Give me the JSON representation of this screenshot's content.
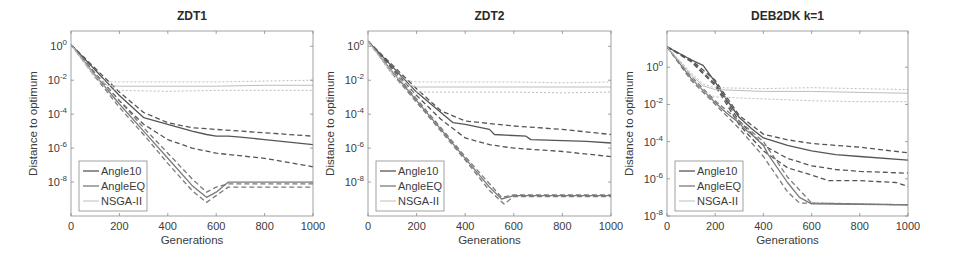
{
  "figure": {
    "width": 953,
    "height": 267
  },
  "styles": {
    "Angle10": {
      "color": "#555555",
      "width": 1.3
    },
    "AngleEQ": {
      "color": "#7a7a7a",
      "width": 1.3
    },
    "NSGA-II": {
      "color": "#bdbdbd",
      "width": 1.0
    },
    "axis_color": "#8a8a8a",
    "text_color": "#3c3c3c"
  },
  "chart_data": [
    {
      "type": "line",
      "title": "ZDT1",
      "xlabel": "Generations",
      "ylabel": "Distance to optimum",
      "yscale": "log",
      "xlim": [
        0,
        1000
      ],
      "ylim_log10": [
        -10,
        0.9
      ],
      "xticks": [
        0,
        200,
        400,
        600,
        800,
        1000
      ],
      "xtick_labels": [
        "0",
        "200",
        "400",
        "600",
        "800",
        "1000"
      ],
      "yticks_log10": [
        0,
        -2,
        -4,
        -6,
        -8
      ],
      "ytick_labels": [
        "10^0",
        "10^-2",
        "10^-4",
        "10^-6",
        "10^-8"
      ],
      "grid": false,
      "legend": {
        "position": "lower left",
        "entries": [
          "Angle10",
          "AngleEQ",
          "NSGA-II"
        ]
      },
      "box": {
        "left": 71,
        "top": 31,
        "right": 313,
        "bottom": 216
      },
      "series": [
        {
          "name": "Angle10",
          "style": "solid",
          "x": [
            0,
            100,
            200,
            300,
            400,
            500,
            560,
            600,
            650,
            700,
            800,
            1000
          ],
          "log10y": [
            0.1,
            -1.4,
            -2.9,
            -4.2,
            -4.6,
            -5.0,
            -5.2,
            -5.3,
            -5.3,
            -5.35,
            -5.5,
            -5.8
          ]
        },
        {
          "name": "Angle10",
          "style": "dashed",
          "x": [
            0,
            100,
            200,
            300,
            400,
            500,
            600,
            800,
            1000
          ],
          "log10y": [
            0.1,
            -1.3,
            -2.7,
            -3.9,
            -4.5,
            -4.8,
            -4.9,
            -5.1,
            -5.3
          ]
        },
        {
          "name": "Angle10",
          "style": "dashed",
          "x": [
            0,
            100,
            200,
            300,
            400,
            500,
            600,
            800,
            1000
          ],
          "log10y": [
            0.1,
            -1.6,
            -3.2,
            -4.6,
            -5.5,
            -6.0,
            -6.3,
            -6.6,
            -7.1
          ]
        },
        {
          "name": "AngleEQ",
          "style": "solid",
          "x": [
            0,
            100,
            200,
            300,
            400,
            500,
            560,
            600,
            650,
            1000
          ],
          "log10y": [
            0.1,
            -1.7,
            -3.4,
            -5.0,
            -6.6,
            -8.2,
            -8.9,
            -8.6,
            -8.0,
            -8.0
          ]
        },
        {
          "name": "AngleEQ",
          "style": "dashed",
          "x": [
            0,
            100,
            200,
            300,
            400,
            500,
            560,
            600,
            650,
            1000
          ],
          "log10y": [
            0.1,
            -1.6,
            -3.2,
            -4.8,
            -6.3,
            -7.8,
            -8.6,
            -8.3,
            -8.1,
            -8.1
          ]
        },
        {
          "name": "AngleEQ",
          "style": "dashed",
          "x": [
            0,
            100,
            200,
            300,
            400,
            500,
            560,
            600,
            650,
            1000
          ],
          "log10y": [
            0.1,
            -1.8,
            -3.6,
            -5.2,
            -6.9,
            -8.5,
            -9.2,
            -8.8,
            -8.3,
            -8.3
          ]
        },
        {
          "name": "NSGA-II",
          "style": "solid",
          "x": [
            0,
            100,
            150,
            200,
            400,
            600,
            800,
            1000
          ],
          "log10y": [
            0.1,
            -1.8,
            -2.3,
            -2.35,
            -2.35,
            -2.35,
            -2.3,
            -2.3
          ]
        },
        {
          "name": "NSGA-II",
          "style": "dashed",
          "x": [
            0,
            100,
            150,
            200,
            400,
            600,
            800,
            1000
          ],
          "log10y": [
            0.1,
            -1.7,
            -2.1,
            -2.1,
            -2.1,
            -2.1,
            -2.05,
            -2.0
          ]
        },
        {
          "name": "NSGA-II",
          "style": "dashed",
          "x": [
            0,
            100,
            150,
            200,
            400,
            600,
            800,
            1000
          ],
          "log10y": [
            0.1,
            -1.9,
            -2.5,
            -2.6,
            -2.65,
            -2.6,
            -2.6,
            -2.6
          ]
        }
      ]
    },
    {
      "type": "line",
      "title": "ZDT2",
      "xlabel": "Generations",
      "ylabel": "Distance to optimum",
      "yscale": "log",
      "xlim": [
        0,
        1000
      ],
      "ylim_log10": [
        -10,
        0.9
      ],
      "xticks": [
        0,
        200,
        400,
        600,
        800,
        1000
      ],
      "xtick_labels": [
        "0",
        "200",
        "400",
        "600",
        "800",
        "1000"
      ],
      "yticks_log10": [
        0,
        -2,
        -4,
        -6,
        -8
      ],
      "ytick_labels": [
        "10^0",
        "10^-2",
        "10^-4",
        "10^-6",
        "10^-8"
      ],
      "grid": false,
      "legend": {
        "position": "lower left",
        "entries": [
          "Angle10",
          "AngleEQ",
          "NSGA-II"
        ]
      },
      "box": {
        "left": 368,
        "top": 31,
        "right": 611,
        "bottom": 216
      },
      "series": [
        {
          "name": "Angle10",
          "style": "solid",
          "x": [
            0,
            100,
            200,
            300,
            350,
            400,
            500,
            520,
            650,
            670,
            900,
            1000
          ],
          "log10y": [
            0.3,
            -1.2,
            -2.7,
            -3.9,
            -4.5,
            -4.6,
            -4.9,
            -5.2,
            -5.3,
            -5.5,
            -5.6,
            -5.7
          ]
        },
        {
          "name": "Angle10",
          "style": "dashed",
          "x": [
            0,
            100,
            200,
            300,
            400,
            600,
            800,
            1000
          ],
          "log10y": [
            0.3,
            -1.1,
            -2.5,
            -3.8,
            -4.4,
            -4.7,
            -4.9,
            -5.2
          ]
        },
        {
          "name": "Angle10",
          "style": "dashed",
          "x": [
            0,
            100,
            200,
            300,
            400,
            500,
            600,
            800,
            1000
          ],
          "log10y": [
            0.3,
            -1.3,
            -2.9,
            -4.3,
            -5.4,
            -5.8,
            -6.0,
            -6.2,
            -6.5
          ]
        },
        {
          "name": "AngleEQ",
          "style": "solid",
          "x": [
            0,
            100,
            200,
            300,
            400,
            500,
            550,
            600,
            1000
          ],
          "log10y": [
            0.3,
            -1.5,
            -3.2,
            -4.9,
            -6.6,
            -8.3,
            -9.0,
            -8.8,
            -8.8
          ]
        },
        {
          "name": "AngleEQ",
          "style": "dashed",
          "x": [
            0,
            100,
            200,
            300,
            400,
            500,
            550,
            600,
            1000
          ],
          "log10y": [
            0.3,
            -1.4,
            -3.1,
            -4.8,
            -6.5,
            -8.1,
            -8.9,
            -8.75,
            -8.75
          ]
        },
        {
          "name": "AngleEQ",
          "style": "dashed",
          "x": [
            0,
            100,
            200,
            300,
            400,
            500,
            560,
            600,
            1000
          ],
          "log10y": [
            0.3,
            -1.6,
            -3.3,
            -5.0,
            -6.7,
            -8.5,
            -9.3,
            -8.85,
            -8.85
          ]
        },
        {
          "name": "NSGA-II",
          "style": "solid",
          "x": [
            0,
            100,
            150,
            200,
            400,
            600,
            800,
            1000
          ],
          "log10y": [
            0.3,
            -1.6,
            -2.2,
            -2.4,
            -2.4,
            -2.4,
            -2.4,
            -2.4
          ]
        },
        {
          "name": "NSGA-II",
          "style": "dashed",
          "x": [
            0,
            100,
            150,
            200,
            400,
            600,
            800,
            1000
          ],
          "log10y": [
            0.3,
            -1.5,
            -2.0,
            -2.1,
            -2.1,
            -2.1,
            -2.15,
            -2.1
          ]
        },
        {
          "name": "NSGA-II",
          "style": "dashed",
          "x": [
            0,
            100,
            150,
            200,
            400,
            600,
            800,
            1000
          ],
          "log10y": [
            0.3,
            -1.7,
            -2.5,
            -2.7,
            -2.7,
            -2.7,
            -2.75,
            -2.7
          ]
        }
      ]
    },
    {
      "type": "line",
      "title": "DEB2DK k=1",
      "xlabel": "Generations",
      "ylabel": "Distance to optimum",
      "yscale": "log",
      "xlim": [
        0,
        1000
      ],
      "ylim_log10": [
        -8,
        1.95
      ],
      "xticks": [
        0,
        200,
        400,
        600,
        800,
        1000
      ],
      "xtick_labels": [
        "0",
        "200",
        "400",
        "600",
        "800",
        "1000"
      ],
      "yticks_log10": [
        0,
        -2,
        -4,
        -6,
        -8
      ],
      "ytick_labels": [
        "10^0",
        "10^-2",
        "10^-4",
        "10^-6",
        "10^-8"
      ],
      "grid": false,
      "legend": {
        "position": "lower left",
        "entries": [
          "Angle10",
          "AngleEQ",
          "NSGA-II"
        ]
      },
      "box": {
        "left": 667,
        "top": 31,
        "right": 908,
        "bottom": 216
      },
      "series": [
        {
          "name": "Angle10",
          "style": "solid",
          "x": [
            0,
            100,
            150,
            200,
            250,
            300,
            350,
            400,
            450,
            500,
            600,
            700,
            800,
            1000
          ],
          "log10y": [
            1.1,
            0.4,
            0.1,
            -0.8,
            -1.8,
            -2.7,
            -3.3,
            -3.8,
            -4.0,
            -4.2,
            -4.5,
            -4.7,
            -4.8,
            -5.0
          ]
        },
        {
          "name": "Angle10",
          "style": "dashed",
          "x": [
            0,
            100,
            200,
            300,
            400,
            500,
            600,
            800,
            1000
          ],
          "log10y": [
            1.1,
            0.4,
            -0.7,
            -2.6,
            -3.6,
            -3.9,
            -4.1,
            -4.3,
            -4.6
          ]
        },
        {
          "name": "Angle10",
          "style": "dashed",
          "x": [
            0,
            100,
            200,
            300,
            400,
            500,
            600,
            700,
            800,
            1000
          ],
          "log10y": [
            1.1,
            0.35,
            -0.9,
            -2.9,
            -4.2,
            -4.9,
            -5.3,
            -5.5,
            -5.6,
            -5.7
          ]
        },
        {
          "name": "Angle10",
          "style": "dashed",
          "x": [
            0,
            100,
            200,
            300,
            400,
            500,
            600,
            670,
            800,
            950,
            1000
          ],
          "log10y": [
            1.1,
            0.3,
            -1.0,
            -3.1,
            -4.5,
            -5.4,
            -5.8,
            -6.1,
            -6.1,
            -6.2,
            -6.4
          ]
        },
        {
          "name": "AngleEQ",
          "style": "solid",
          "x": [
            0,
            100,
            200,
            250,
            300,
            320,
            350,
            400,
            420,
            500,
            550,
            600,
            1000
          ],
          "log10y": [
            1.1,
            -0.6,
            -1.9,
            -2.5,
            -3.0,
            -3.3,
            -3.6,
            -4.2,
            -4.7,
            -6.2,
            -7.0,
            -7.35,
            -7.4
          ]
        },
        {
          "name": "AngleEQ",
          "style": "dashed",
          "x": [
            0,
            100,
            200,
            300,
            400,
            500,
            600,
            1000
          ],
          "log10y": [
            1.1,
            -0.5,
            -1.8,
            -2.9,
            -4.0,
            -5.9,
            -7.3,
            -7.4
          ]
        },
        {
          "name": "AngleEQ",
          "style": "dashed",
          "x": [
            0,
            100,
            200,
            300,
            400,
            500,
            550,
            1000
          ],
          "log10y": [
            1.1,
            -0.7,
            -2.0,
            -3.3,
            -4.8,
            -6.7,
            -7.3,
            -7.4
          ]
        },
        {
          "name": "NSGA-II",
          "style": "solid",
          "x": [
            0,
            100,
            150,
            200,
            400,
            600,
            800,
            1000
          ],
          "log10y": [
            1.1,
            -0.4,
            -1.0,
            -1.2,
            -1.3,
            -1.3,
            -1.35,
            -1.4
          ]
        },
        {
          "name": "NSGA-II",
          "style": "dashed",
          "x": [
            0,
            100,
            150,
            200,
            400,
            600,
            800,
            1000
          ],
          "log10y": [
            1.1,
            -0.3,
            -0.9,
            -1.1,
            -1.15,
            -1.1,
            -1.15,
            -1.2
          ]
        },
        {
          "name": "NSGA-II",
          "style": "dashed",
          "x": [
            0,
            100,
            150,
            200,
            400,
            600,
            800,
            1000
          ],
          "log10y": [
            1.1,
            -0.5,
            -1.3,
            -1.6,
            -1.7,
            -1.8,
            -1.85,
            -1.85
          ]
        }
      ]
    }
  ]
}
